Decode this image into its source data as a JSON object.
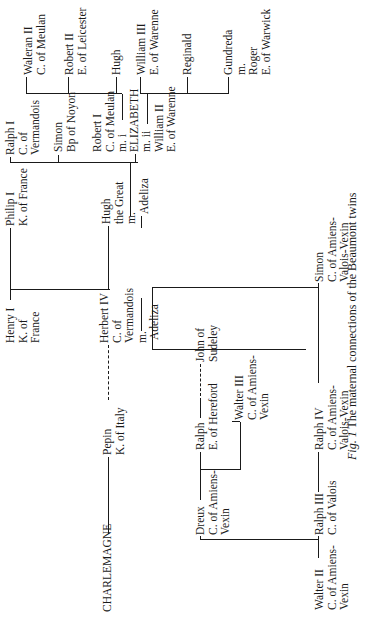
{
  "caption": {
    "fig_label": "Fig. 1",
    "text": "The maternal connections of the Beaumont twins"
  },
  "nodes": {
    "charlemagne": [
      "CHARLEMAGNE"
    ],
    "pepin": [
      "Pepin",
      "K. of Italy"
    ],
    "herbert": [
      "Herbert IV",
      "C. of",
      "Vermandois",
      "m."
    ],
    "adeliza_herbert": [
      "Adeliza"
    ],
    "henry": [
      "Henry I",
      "K. of",
      "France"
    ],
    "philip": [
      "Philip I",
      "K. of France"
    ],
    "hugh_great": [
      "Hugh",
      "the Great",
      "m."
    ],
    "adeliza_hugh": [
      "Adeliza"
    ],
    "ralph1": [
      "Ralph I",
      "C. of",
      "Vermandois"
    ],
    "simon_bp": [
      "Simon",
      "Bp of Noyon"
    ],
    "robert1": [
      "Robert I",
      "C. of Meulan",
      "m. i"
    ],
    "elizabeth": [
      "ELIZABETH"
    ],
    "william2": [
      "m. ii",
      "William II",
      "E. of Warenne"
    ],
    "waleran": [
      "Waleran II",
      "C. of Meulan"
    ],
    "robert2": [
      "Robert II",
      "E. of Leicester"
    ],
    "hugh": [
      "Hugh"
    ],
    "william3": [
      "William III",
      "E. of Warenne"
    ],
    "reginald": [
      "Reginald"
    ],
    "gundreda": [
      "Gundreda",
      "m.",
      "Roger",
      "E. of Warwick"
    ],
    "simon_amiens": [
      "Simon",
      "C. of Amiens-",
      "Valois-Vexin"
    ],
    "john": [
      "John of",
      "Sudeley"
    ],
    "ralph_hereford": [
      "Ralph",
      "E. of Hereford"
    ],
    "walter3": [
      "Walter III",
      "C. of Amiens-",
      "Vexin"
    ],
    "dreux": [
      "Dreux",
      "C. of Amiens-",
      "Vexin"
    ],
    "ralph3": [
      "Ralph III",
      "C. of Valois"
    ],
    "ralph4": [
      "Ralph IV",
      "C. of Amiens-",
      "Valois-Vexin"
    ],
    "walter2": [
      "Walter II",
      "C. of Amiens-",
      "Vexin"
    ]
  }
}
